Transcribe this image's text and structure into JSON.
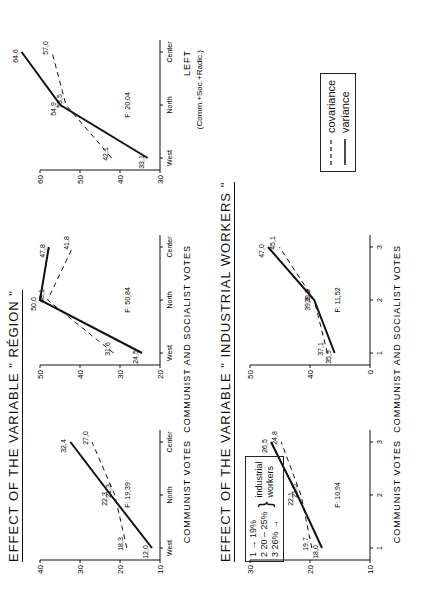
{
  "titles": {
    "region": "EFFECT OF THE VARIABLE \" RÉGION \"",
    "industrial": "EFFECT OF THE VARIABLE \" INDUSTRIAL WORKERS \""
  },
  "legend": {
    "covariance": "covariance",
    "variance": "variance"
  },
  "industrial_key": {
    "rows": [
      "1 → 19%",
      "2  20 – 25%",
      "3  26% →"
    ],
    "label_line1": "industrial",
    "label_line2": "workers"
  },
  "chart_data": [
    {
      "type": "line",
      "group": "region",
      "title": "COMMUNIST VOTES",
      "f_stat": "F: 19,39",
      "categories": [
        "West",
        "North",
        "Center"
      ],
      "ylim": [
        10,
        40
      ],
      "yticks": [
        10,
        20,
        30,
        40
      ],
      "series": [
        {
          "name": "variance",
          "style": "solid",
          "values": [
            12.0,
            22.3,
            32.4
          ],
          "labels": [
            "12,0",
            "22,3",
            "32,4"
          ]
        },
        {
          "name": "covariance",
          "style": "dashed",
          "values": [
            18.3,
            21.3,
            27.0
          ],
          "labels": [
            "18,3",
            "21,3",
            "27,0"
          ]
        }
      ]
    },
    {
      "type": "line",
      "group": "region",
      "title": "COMMUNIST AND SOCIALIST VOTES",
      "f_stat": "F: 50,84",
      "categories": [
        "West",
        "North",
        "Center"
      ],
      "ylim": [
        20,
        50
      ],
      "yticks": [
        20,
        30,
        40,
        50
      ],
      "series": [
        {
          "name": "variance",
          "style": "solid",
          "values": [
            24.5,
            50.0,
            47.8
          ],
          "labels": [
            "24,5",
            "50,0",
            "47,8"
          ]
        },
        {
          "name": "covariance",
          "style": "dashed",
          "values": [
            31.6,
            48.1,
            41.8
          ],
          "labels": [
            "31,6",
            "48,1",
            "41,8"
          ]
        }
      ]
    },
    {
      "type": "line",
      "group": "region",
      "title": "LEFT",
      "subtitle": "(Comm.+Soc.+Radic.)",
      "f_stat": "F: 20,04",
      "categories": [
        "West",
        "North",
        "Center"
      ],
      "ylim": [
        30,
        60
      ],
      "yticks": [
        30,
        40,
        50,
        60
      ],
      "series": [
        {
          "name": "variance",
          "style": "solid",
          "values": [
            33.1,
            54.9,
            64.6
          ],
          "labels": [
            "33,1",
            "54,9",
            "64,6"
          ]
        },
        {
          "name": "covariance",
          "style": "dashed",
          "values": [
            42.1,
            53.5,
            57.0
          ],
          "labels": [
            "42,1",
            "53,5",
            "57,0"
          ]
        }
      ]
    },
    {
      "type": "line",
      "group": "industrial",
      "title": "COMMUNIST VOTES",
      "f_stat": "F: 10,94",
      "categories": [
        "1",
        "2",
        "3"
      ],
      "ylim": [
        10,
        30
      ],
      "yticks": [
        10,
        20,
        30
      ],
      "series": [
        {
          "name": "variance",
          "style": "solid",
          "values": [
            18.0,
            22.1,
            26.5
          ],
          "labels": [
            "18,0",
            "22,1",
            "26,5"
          ]
        },
        {
          "name": "covariance",
          "style": "dashed",
          "values": [
            19.7,
            21.5,
            24.8
          ],
          "labels": [
            "19,7",
            "21,5",
            "24,8"
          ]
        }
      ]
    },
    {
      "type": "line",
      "group": "industrial",
      "title": "COMMUNIST AND SOCIALIST VOTES",
      "f_stat": "F: 11,52",
      "categories": [
        "1",
        "2",
        "3"
      ],
      "ylim": [
        30,
        50
      ],
      "yticks": [
        0,
        40,
        50
      ],
      "series": [
        {
          "name": "variance",
          "style": "solid",
          "values": [
            35.9,
            39.3,
            47.0
          ],
          "labels": [
            "35,9",
            "39,3",
            "47,0"
          ]
        },
        {
          "name": "covariance",
          "style": "dashed",
          "values": [
            37.1,
            39.3,
            45.1
          ],
          "labels": [
            "37,1",
            "39,3",
            "45,1"
          ]
        }
      ]
    }
  ]
}
